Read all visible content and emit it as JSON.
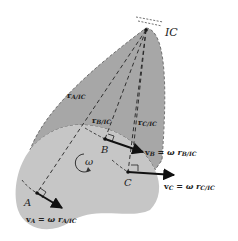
{
  "diagram": {
    "colors": {
      "background": "#ffffff",
      "velocity_cone": "#a7a7a7",
      "body": "#c6c6c6",
      "line": "#222222"
    },
    "labels": {
      "ic": "IC",
      "point_a": "A",
      "point_b": "B",
      "point_c": "C",
      "omega": "ω",
      "r_a": "r",
      "r_a_sub": "A/IC",
      "r_b": "r",
      "r_b_sub": "B/IC",
      "r_c": "r",
      "r_c_sub": "C/IC",
      "v_a": "v",
      "v_a_sub": "A",
      "v_a_eq": " = ω r",
      "v_a_eq_sub": "A/IC",
      "v_b": "v",
      "v_b_sub": "B",
      "v_b_eq": " = ω r",
      "v_b_eq_sub": "B/IC",
      "v_c": "v",
      "v_c_sub": "C",
      "v_c_eq": " = ω r",
      "v_c_eq_sub": "C/IC"
    }
  }
}
